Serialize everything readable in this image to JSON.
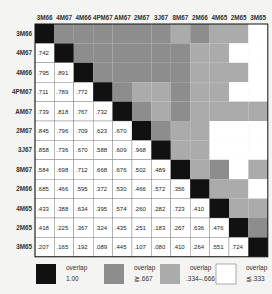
{
  "chart_data": {
    "type": "heatmap",
    "title": "",
    "labels": [
      "3M66",
      "4M67",
      "4M66",
      "4PM67",
      "AM67",
      "2M67",
      "3J67",
      "8M67",
      "2M66",
      "4M65",
      "2M65",
      "3M65"
    ],
    "lower_triangle": [
      [],
      [
        ".742"
      ],
      [
        ".795",
        ".891"
      ],
      [
        ".711",
        ".789",
        ".772"
      ],
      [
        ".739",
        ".818",
        ".767",
        ".732"
      ],
      [
        ".845",
        ".796",
        ".709",
        ".623",
        ".670"
      ],
      [
        ".858",
        ".736",
        ".670",
        ".588",
        ".609",
        ".968"
      ],
      [
        ".584",
        ".698",
        ".712",
        ".668",
        ".676",
        ".502",
        ".489"
      ],
      [
        ".685",
        ".466",
        ".595",
        ".372",
        ".530",
        ".466",
        ".572",
        ".356"
      ],
      [
        ".433",
        ".388",
        ".634",
        ".395",
        ".574",
        ".260",
        ".282",
        ".723",
        ".410"
      ],
      [
        ".418",
        ".225",
        ".367",
        ".324",
        ".435",
        ".251",
        ".183",
        ".267",
        ".636",
        ".476"
      ],
      [
        ".207",
        ".165",
        ".192",
        ".089",
        ".445",
        ".107",
        ".080",
        ".410",
        ".264",
        ".551",
        ".724"
      ]
    ],
    "diagonal_value": 1.0,
    "upper_triangle": "mirror of lower triangle, shaded by category",
    "categories": [
      {
        "name": "overlap 1.00",
        "line1": "overlap",
        "line2": "1.00",
        "color": "#111111"
      },
      {
        "name": "overlap >= .667",
        "line1": "overlap",
        "line2": "≧.667",
        "color": "#8d8d8d"
      },
      {
        "name": "overlap .334-.666",
        "line1": "overlap",
        "line2": ".334–.666",
        "color": "#ababab"
      },
      {
        "name": "overlap <= .333",
        "line1": "overlap",
        "line2": "≦.333",
        "color": "#ffffff"
      }
    ],
    "thresholds": {
      "high": 0.667,
      "mid_low": 0.334
    },
    "legend_position": "bottom"
  }
}
